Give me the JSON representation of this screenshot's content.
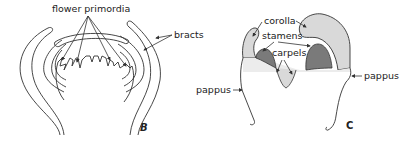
{
  "panels": [
    {
      "id": "B",
      "label": "B",
      "annotations": {
        "flower_primordia": "flower primordia",
        "bracts": "bracts"
      }
    },
    {
      "id": "C",
      "label": "C",
      "annotations": {
        "corolla": "corolla",
        "stamens": "stamens",
        "carpels": "carpels",
        "pappus_left": "pappus",
        "pappus_right": "pappus"
      }
    }
  ],
  "colors": {
    "line": "#333333",
    "corolla_fill": "#d9d9d9",
    "stamen_fill": "#7a7a7a",
    "background": "#ffffff"
  }
}
